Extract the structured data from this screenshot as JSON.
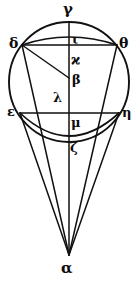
{
  "figure": {
    "ink_color": "#111111",
    "background_color": "#ffffff",
    "width": 139,
    "height": 283
  },
  "labels": [
    {
      "id": "gamma",
      "text": "γ",
      "x": 63,
      "y": 2,
      "size": 15,
      "role": "top-of-circle-point"
    },
    {
      "id": "delta",
      "text": "δ",
      "x": 9,
      "y": 36,
      "size": 14,
      "role": "left-upper-chord-endpoint"
    },
    {
      "id": "theta",
      "text": "θ",
      "x": 119,
      "y": 36,
      "size": 14,
      "role": "right-upper-chord-endpoint"
    },
    {
      "id": "iota",
      "text": "ι",
      "x": 72,
      "y": 33,
      "size": 13,
      "role": "upper-arc-midpoint"
    },
    {
      "id": "kappa",
      "text": "ϰ",
      "x": 71,
      "y": 53,
      "size": 14,
      "role": "axis-point-below-upper-chord"
    },
    {
      "id": "beta",
      "text": "β",
      "x": 72,
      "y": 73,
      "size": 13,
      "role": "center-of-circle"
    },
    {
      "id": "lambda",
      "text": "λ",
      "x": 53,
      "y": 91,
      "size": 13,
      "role": "axis-point-above-lower-chord"
    },
    {
      "id": "epsilon",
      "text": "ε",
      "x": 7,
      "y": 105,
      "size": 13,
      "role": "left-lower-chord-endpoint"
    },
    {
      "id": "eta",
      "text": "η",
      "x": 122,
      "y": 106,
      "size": 13,
      "role": "right-lower-chord-endpoint"
    },
    {
      "id": "mu",
      "text": "μ",
      "x": 71,
      "y": 116,
      "size": 13,
      "role": "lower-arc-midpoint"
    },
    {
      "id": "zeta",
      "text": "ζ",
      "x": 70,
      "y": 141,
      "size": 13,
      "role": "bottom-of-circle-point"
    },
    {
      "id": "alpha",
      "text": "α",
      "x": 61,
      "y": 261,
      "size": 15,
      "role": "cone-apex-vertex"
    }
  ],
  "geometry": {
    "circle": {
      "cx": 69,
      "cy": 82,
      "r": 60,
      "stroke_width": 1.9
    },
    "vertical_axis": {
      "x": 69,
      "y1": 22,
      "y2": 255,
      "stroke_width": 1.5
    },
    "upper_chord": {
      "x1": 22,
      "y1": 45,
      "x2": 117,
      "y2": 45,
      "stroke_width": 1.6
    },
    "lower_chord": {
      "x1": 20,
      "y1": 113,
      "x2": 119,
      "y2": 113,
      "stroke_width": 1.6
    },
    "upper_arc": {
      "from": "delta",
      "to": "theta",
      "bulge_y": 29,
      "stroke_width": 1.7
    },
    "lower_arc": {
      "from": "epsilon",
      "to": "eta",
      "bulge_y": 136,
      "stroke_width": 1.7
    },
    "radius_line": {
      "from": "delta",
      "to": "beta",
      "stroke_width": 1.5
    },
    "cone_lines": [
      {
        "from": "delta",
        "to": "alpha",
        "stroke_width": 1.5
      },
      {
        "from": "epsilon",
        "to": "alpha",
        "stroke_width": 1.5
      },
      {
        "from": "eta",
        "to": "alpha",
        "stroke_width": 1.5
      },
      {
        "from": "theta",
        "to": "alpha",
        "stroke_width": 1.5
      }
    ],
    "apex": {
      "x": 69,
      "y": 255
    }
  }
}
